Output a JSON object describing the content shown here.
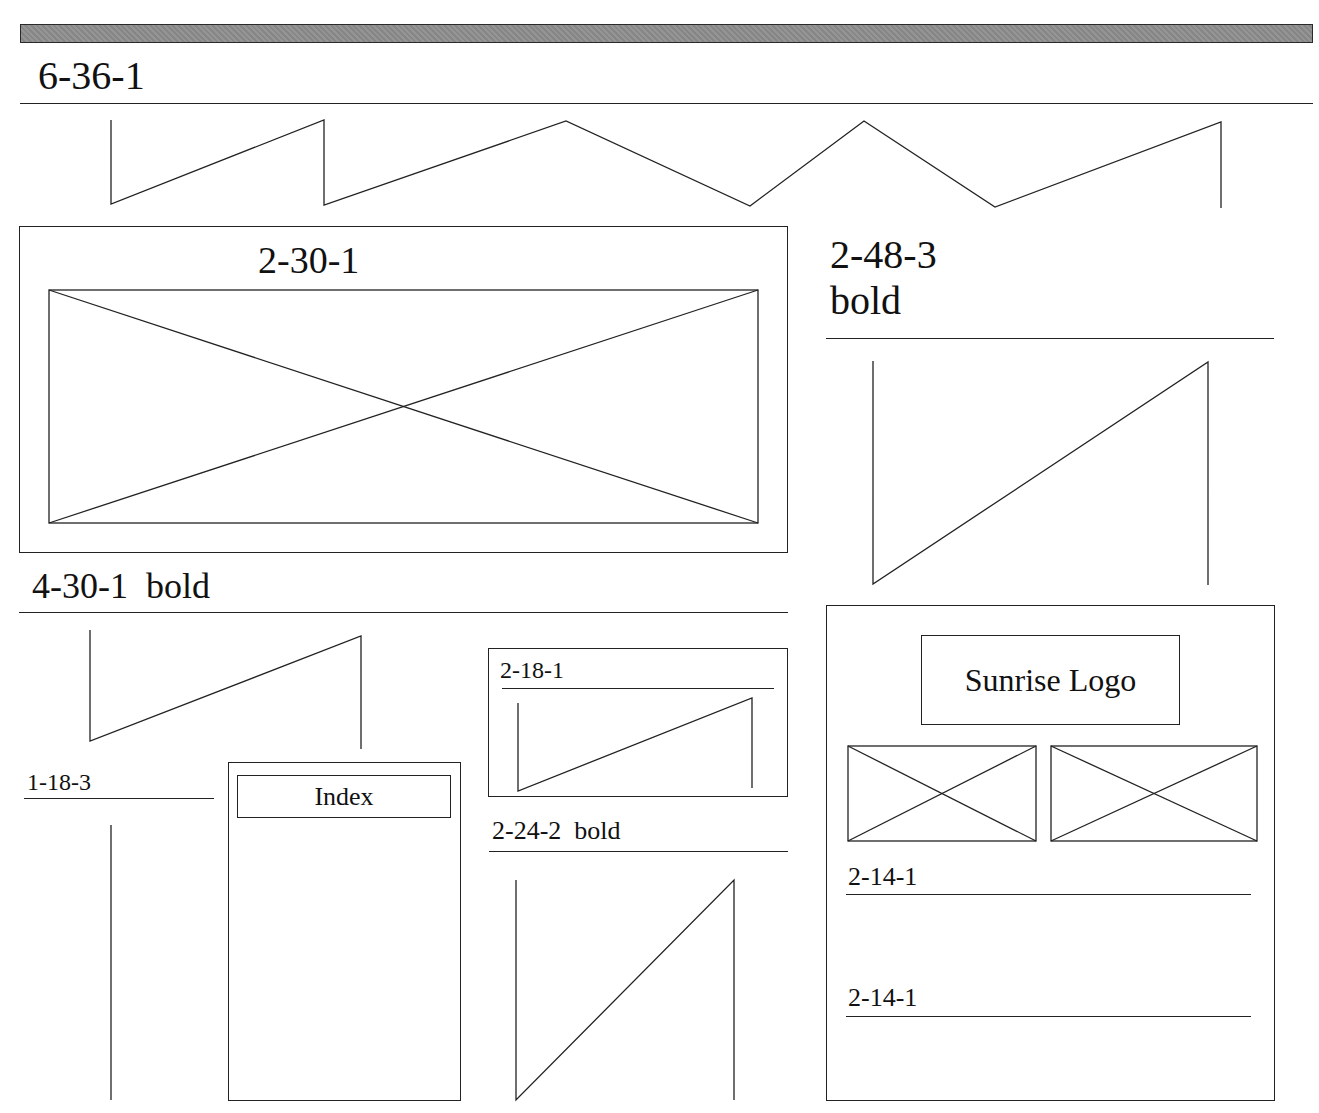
{
  "header": {
    "banner": "gray-header-bar",
    "title": "6-36-1"
  },
  "sections": {
    "top_zigzag": {
      "type": "text-placeholder-zigzag"
    },
    "image_panel": {
      "label": "2-30-1",
      "placeholder": "image-placeholder"
    },
    "right_heading": {
      "line1": "2-48-3",
      "line2": "bold"
    },
    "left_heading": {
      "label": "4-30-1",
      "suffix": "bold"
    },
    "small_heading": {
      "label": "1-18-3"
    },
    "index_box": {
      "label": "Index"
    },
    "small_panel": {
      "label": "2-18-1"
    },
    "mid_heading": {
      "label": "2-24-2",
      "suffix": "bold"
    },
    "logo_panel": {
      "logo_label": "Sunrise Logo",
      "images": [
        "image-placeholder",
        "image-placeholder"
      ],
      "lines": [
        {
          "label": "2-14-1"
        },
        {
          "label": "2-14-1"
        }
      ]
    }
  },
  "colors": {
    "stroke": "#222222",
    "banner_fill": "#8e8e8e",
    "background": "#ffffff"
  }
}
